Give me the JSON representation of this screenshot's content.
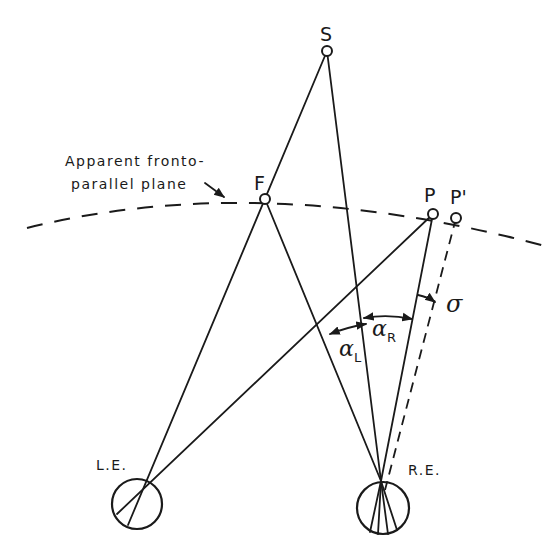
{
  "diagram": {
    "plane_label_line1": "Apparent fronto-",
    "plane_label_line2": "parallel plane",
    "points": {
      "S": {
        "label": "S",
        "x": 327,
        "y": 51
      },
      "F": {
        "label": "F",
        "x": 265,
        "y": 199
      },
      "P": {
        "label": "P",
        "x": 433,
        "y": 214
      },
      "P_prime": {
        "label": "P'",
        "x": 456,
        "y": 218
      }
    },
    "eyes": {
      "left": {
        "label": "L.E.",
        "cx": 137,
        "cy": 504,
        "r": 25
      },
      "right": {
        "label": "R.E.",
        "cx": 383,
        "cy": 508,
        "r": 26
      }
    },
    "angles": {
      "alpha_L": {
        "symbol": "α",
        "subscript": "L"
      },
      "alpha_R": {
        "symbol": "α",
        "subscript": "R"
      },
      "sigma": {
        "symbol": "σ"
      }
    },
    "colors": {
      "ink": "#1a1a1a",
      "background": "#ffffff"
    }
  }
}
